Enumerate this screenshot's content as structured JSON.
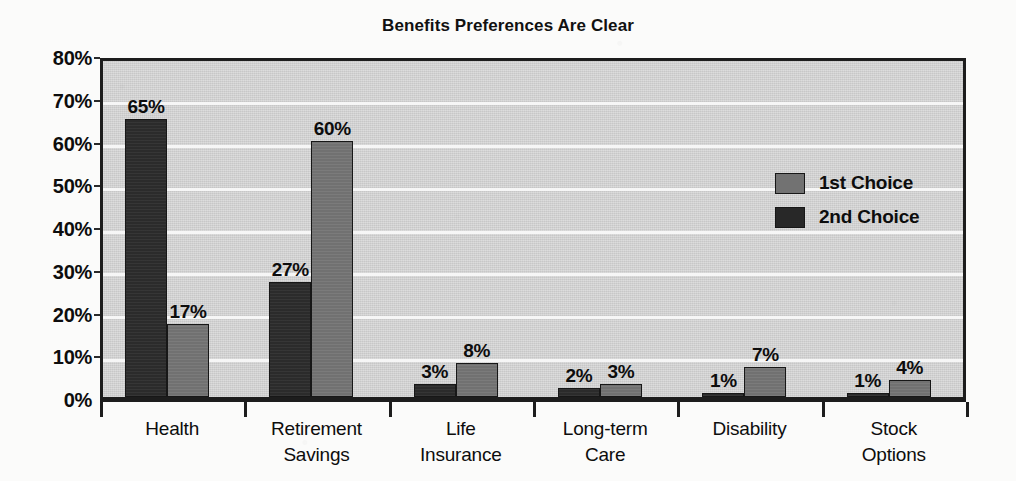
{
  "chart_data": {
    "type": "bar",
    "title": "Benefits Preferences Are Clear",
    "xlabel": "",
    "ylabel": "",
    "ylim": [
      0,
      80
    ],
    "ytick_labels": [
      "0%",
      "10%",
      "20%",
      "30%",
      "40%",
      "50%",
      "60%",
      "70%",
      "80%"
    ],
    "ytick_values": [
      0,
      10,
      20,
      30,
      40,
      50,
      60,
      70,
      80
    ],
    "grid": "horizontal",
    "legend_position": "upper-right",
    "value_label_suffix": "%",
    "categories": [
      "Health",
      "Retirement Savings",
      "Life Insurance",
      "Long-term Care",
      "Disability",
      "Stock Options"
    ],
    "category_lines": [
      [
        "Health"
      ],
      [
        "Retirement",
        "Savings"
      ],
      [
        "Life",
        "Insurance"
      ],
      [
        "Long-term",
        "Care"
      ],
      [
        "Disability"
      ],
      [
        "Stock",
        "Options"
      ]
    ],
    "series": [
      {
        "name": "2nd Choice",
        "color": "#2b2b2b",
        "values": [
          65,
          27,
          3,
          2,
          1,
          1
        ],
        "labels": [
          "65%",
          "27%",
          "3%",
          "2%",
          "1%",
          "1%"
        ]
      },
      {
        "name": "1st Choice",
        "color": "#717171",
        "values": [
          17,
          60,
          8,
          3,
          7,
          4
        ],
        "labels": [
          "17%",
          "60%",
          "8%",
          "3%",
          "7%",
          "4%"
        ]
      }
    ],
    "legend": [
      {
        "label": "1st Choice",
        "color": "#717171"
      },
      {
        "label": "2nd Choice",
        "color": "#2b2b2b"
      }
    ],
    "colors": {
      "plot_background": "#cfcfcf",
      "page_background": "#fbfbfa",
      "gridline": "#f6f6f6",
      "axis": "#1d1d1d",
      "text": "#0d0d0d"
    }
  }
}
